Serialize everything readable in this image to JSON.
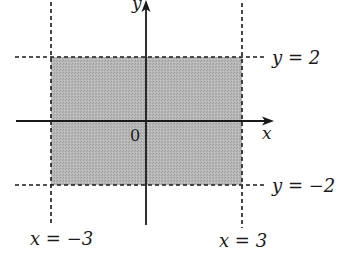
{
  "diagram": {
    "type": "region-plot",
    "colors": {
      "region_fill": "#b3b3b3",
      "lines": "#1a1a1a",
      "background": "#ffffff"
    },
    "axes": {
      "x_label": "x",
      "y_label": "y",
      "origin_label": "0"
    },
    "boundaries": {
      "top": {
        "label": "y = 2",
        "value": 2
      },
      "bottom": {
        "label": "y = −2",
        "value": -2
      },
      "left": {
        "label": "x = −3",
        "value": -3
      },
      "right": {
        "label": "x = 3",
        "value": 3
      }
    },
    "region": {
      "x_min": -3,
      "x_max": 3,
      "y_min": -2,
      "y_max": 2
    }
  }
}
